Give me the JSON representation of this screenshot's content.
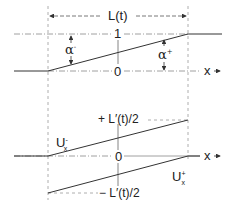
{
  "diagram": {
    "top_panel": {
      "width_label": "L(t)",
      "level_one_label": "1",
      "level_zero_label": "0",
      "alpha_minus": {
        "symbol": "α",
        "superscript": "-"
      },
      "alpha_plus": {
        "symbol": "α",
        "superscript": "+"
      },
      "x_axis_label": "x"
    },
    "bottom_panel": {
      "upper_level_label": "+ L′(t)/2",
      "lower_level_label": "− L′(t)/2",
      "zero_label": "0",
      "u_minus": {
        "symbol": "U",
        "superscript": "-",
        "subscript": "x"
      },
      "u_plus": {
        "symbol": "U",
        "superscript": "+",
        "subscript": "x"
      },
      "x_axis_label": "x"
    },
    "colors": {
      "line": "#333333",
      "dashed": "#999999",
      "text": "#222222"
    }
  }
}
